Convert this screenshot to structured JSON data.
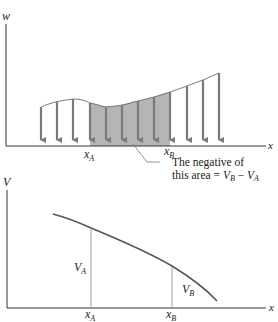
{
  "figure": {
    "top_panel": {
      "y_axis_label": "w",
      "x_axis_label": "x",
      "point_labels": [
        {
          "name": "x",
          "sub": "A"
        },
        {
          "name": "x",
          "sub": "B"
        }
      ],
      "annotation_line1": "The negative of",
      "annotation_line2_prefix": "this area = ",
      "annotation_eq": {
        "lhs": "V",
        "lhs_sub": "B",
        "op": " − ",
        "rhs": "V",
        "rhs_sub": "A"
      },
      "load_arrow_count": 12,
      "shaded_between": [
        "x_A",
        "x_B"
      ],
      "colors": {
        "arrow": "#7a7a7a",
        "shade": "#b5b5b5",
        "axis": "#333333",
        "curve": "#555555"
      }
    },
    "bottom_panel": {
      "y_axis_label": "V",
      "x_axis_label": "x",
      "point_labels": [
        {
          "name": "x",
          "sub": "A"
        },
        {
          "name": "x",
          "sub": "B"
        }
      ],
      "ordinate_labels": [
        {
          "name": "V",
          "sub": "A"
        },
        {
          "name": "V",
          "sub": "B"
        }
      ],
      "colors": {
        "curve": "#555555",
        "axis": "#333333",
        "ordinate": "#888888"
      }
    }
  }
}
